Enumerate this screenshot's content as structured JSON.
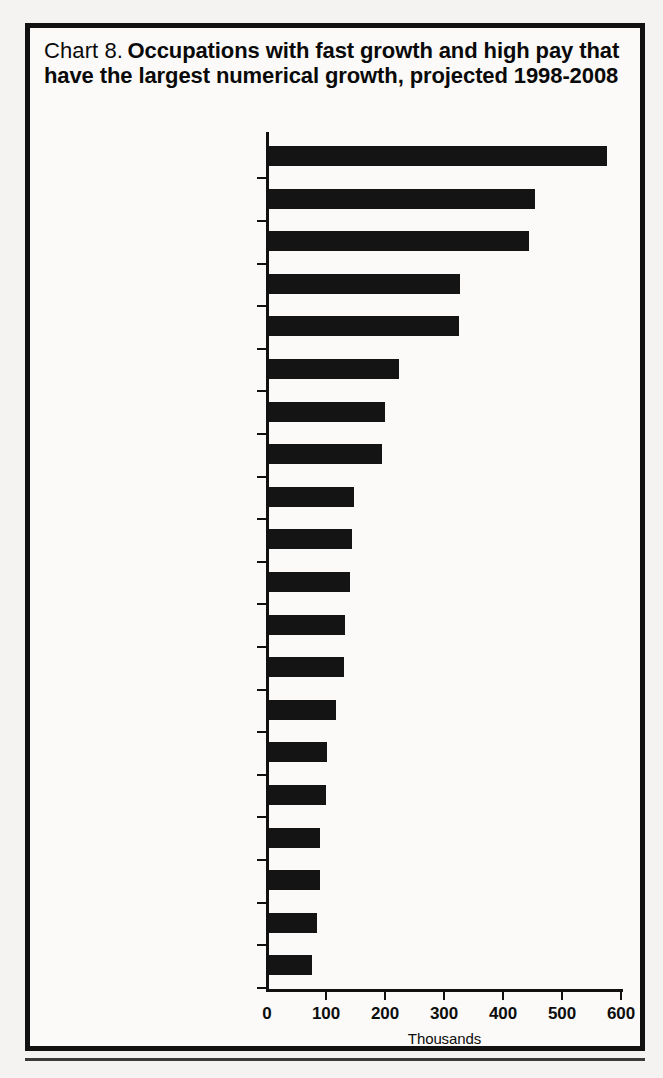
{
  "figure": {
    "title_prefix": "Chart 8.",
    "title_main": "Occupations with fast growth and high pay that have the largest numerical growth, projected 1998-2008",
    "frame_color": "#111111",
    "bar_color": "#141414",
    "background_color": "#fbfaf8"
  },
  "chart_data": {
    "type": "bar",
    "orientation": "horizontal",
    "title": "Chart 8.  Occupations with fast growth and high pay that have the largest numerical growth, projected 1998-2008",
    "xlabel": "Thousands",
    "ylabel": "",
    "xlim": [
      0,
      600
    ],
    "xticks": [
      0,
      100,
      200,
      300,
      400,
      500,
      600
    ],
    "xtick_labels": [
      "0",
      "100",
      "200",
      "300",
      "400",
      "500",
      "600"
    ],
    "grid": false,
    "legend": false,
    "categories": [
      "Computer systems analysts",
      "Registered nurses",
      "Computer support specialists",
      "Computer engineers",
      "Teachers, secondary school",
      "Social workers",
      "College and university faculty",
      "Computer programmers",
      "Engineering, science, and computer systems managers",
      "Police patrol officers",
      "Teachers, special education",
      "Securities and financial servicessales agents",
      "Physicians",
      "Advertising, marketing, and public relations managers",
      "Management analysts",
      "Electrical and electronics engineers",
      "Paralegals and legal assistants",
      "Writers and editors",
      "Artists and commercial artists",
      "Medical and health service managers"
    ],
    "category_lines": [
      [
        "Computer systems analysts"
      ],
      [
        "Registered nurses"
      ],
      [
        "Computer support specialists"
      ],
      [
        "Computer engineers"
      ],
      [
        "Teachers, secondary school"
      ],
      [
        "Social workers"
      ],
      [
        "College and university faculty"
      ],
      [
        "Computer programmers"
      ],
      [
        "Engineering, science, and",
        "computer systems managers"
      ],
      [
        "Police patrol officers"
      ],
      [
        "Teachers, special education"
      ],
      [
        "Securities and financial",
        "servicessales agents"
      ],
      [
        "Physicians"
      ],
      [
        "Advertising, marketing, and",
        "public relations managers"
      ],
      [
        "Management analysts"
      ],
      [
        "Electrical and electronics",
        "engineers"
      ],
      [
        "Paralegals and legal assistants"
      ],
      [
        "Writers and editors"
      ],
      [
        "Artists and commercial artists"
      ],
      [
        "Medical and health service",
        "managers"
      ]
    ],
    "values": [
      573,
      451,
      441,
      323,
      322,
      220,
      196,
      191,
      144,
      140,
      137,
      128,
      127,
      113,
      98,
      96,
      86,
      86,
      81,
      73
    ],
    "units": "thousands"
  }
}
